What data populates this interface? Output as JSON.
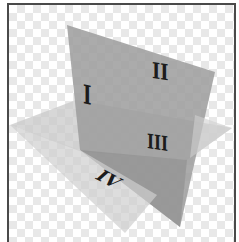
{
  "diagram": {
    "planes": {
      "vertical": {
        "color": "#9a9a9a",
        "opacity": 0.85
      },
      "horizontal": {
        "color": "#c4c4c4",
        "opacity": 0.75
      }
    },
    "labels": {
      "q1": "I",
      "q2": "II",
      "q3": "III",
      "q4": "IV"
    },
    "background": {
      "pattern": "checkerboard",
      "light": "#ffffff",
      "dark": "#e8e8e8"
    },
    "frame_color": "#4a4a4a"
  }
}
